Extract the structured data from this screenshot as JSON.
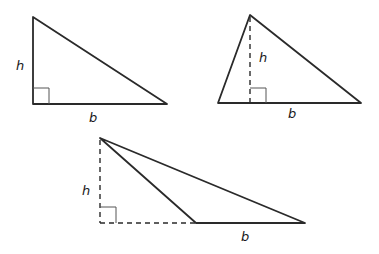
{
  "diagram": {
    "title": "",
    "triangles": [
      {
        "id": "right-triangle",
        "vertices": [
          [
            33,
            17
          ],
          [
            33,
            104
          ],
          [
            167,
            104
          ]
        ],
        "height_label": "h",
        "base_label": "b",
        "h_pos": [
          22,
          70
        ],
        "b_pos": [
          93,
          122
        ],
        "altitude": "side",
        "right_angle_box": [
          33,
          88,
          16,
          16
        ]
      },
      {
        "id": "acute-triangle",
        "vertices": [
          [
            250,
            15
          ],
          [
            218,
            103
          ],
          [
            361,
            103
          ]
        ],
        "height_label": "h",
        "base_label": "b",
        "h_pos": [
          263,
          62
        ],
        "b_pos": [
          293,
          118
        ],
        "altitude": "dashed-interior",
        "right_angle_box": [
          250,
          88,
          16,
          15
        ]
      },
      {
        "id": "obtuse-triangle",
        "vertices": [
          [
            100,
            138
          ],
          [
            196,
            223
          ],
          [
            305,
            223
          ]
        ],
        "height_label": "h",
        "base_label": "b",
        "h_pos": [
          87,
          195
        ],
        "b_pos": [
          245,
          241
        ],
        "altitude": "dashed-exterior",
        "right_angle_box": [
          100,
          207,
          16,
          16
        ]
      }
    ],
    "colors": {
      "line": "#2a2a2a",
      "background": "#ffffff"
    }
  }
}
